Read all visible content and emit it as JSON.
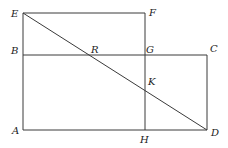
{
  "diagram": {
    "type": "geometry",
    "colors": {
      "line": "#3a3a3a",
      "label": "#222222",
      "background": "#ffffff"
    },
    "points": {
      "E": {
        "label": "E",
        "x": 23,
        "y": 13
      },
      "F": {
        "label": "F",
        "x": 145,
        "y": 13
      },
      "B": {
        "label": "B",
        "x": 23,
        "y": 55
      },
      "R": {
        "label": "R",
        "x": 91,
        "y": 55
      },
      "G": {
        "label": "G",
        "x": 145,
        "y": 55
      },
      "C": {
        "label": "C",
        "x": 207,
        "y": 55
      },
      "K": {
        "label": "K",
        "x": 145,
        "y": 85
      },
      "A": {
        "label": "A",
        "x": 23,
        "y": 130
      },
      "H": {
        "label": "H",
        "x": 145,
        "y": 130
      },
      "D": {
        "label": "D",
        "x": 207,
        "y": 130
      }
    },
    "segments": [
      {
        "name": "EF",
        "from": "E",
        "to": "F"
      },
      {
        "name": "FH",
        "from": "F",
        "to": "H"
      },
      {
        "name": "EA",
        "from": "E",
        "to": "A"
      },
      {
        "name": "BC",
        "from": "B",
        "to": "C"
      },
      {
        "name": "CD",
        "from": "C",
        "to": "D"
      },
      {
        "name": "AD",
        "from": "A",
        "to": "D"
      },
      {
        "name": "ED",
        "from": "E",
        "to": "D"
      }
    ],
    "labels": {
      "E": "E",
      "F": "F",
      "B": "B",
      "R": "R",
      "G": "G",
      "C": "C",
      "K": "K",
      "A": "A",
      "H": "H",
      "D": "D"
    }
  }
}
